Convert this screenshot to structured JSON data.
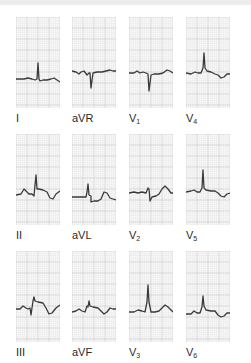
{
  "figure": {
    "colors": {
      "grid_minor": "#e4e4e4",
      "grid_major": "#c8c8c8",
      "trace": "#3a3a3a",
      "label": "#2a2a2a",
      "paper": "#fafafa"
    },
    "layout": {
      "columns_x": [
        16,
        72,
        129,
        186
      ],
      "rows_y": [
        17,
        134,
        251
      ],
      "label_offset_y": 96
    },
    "leads": [
      {
        "id": "I",
        "label": "I",
        "sub": "",
        "col": 0,
        "row": 0,
        "path": "M0,62 L8,62 L12,61 L16,62 L19,63 L21,62 L22,46 L23,62 L24,64 L27,63 L31,63 L35,62 L38,61 L41,63 L44,65"
      },
      {
        "id": "aVR",
        "label": "aVR",
        "sub": "",
        "col": 1,
        "row": 0,
        "path": "M0,54 L4,55 L7,57 L9,55 L12,54 L15,58 L17,56 L18,56 L19,71 L21,56 L25,55 L30,55 L34,54 L38,53 L41,54 L44,54"
      },
      {
        "id": "V1",
        "label": "V",
        "sub": "1",
        "col": 2,
        "row": 0,
        "path": "M0,56 L5,56 L8,54 L11,56 L14,55 L17,56 L19,57 L20,74 L22,58 L25,57 L30,57 L34,56 L38,53 L41,54 L44,56"
      },
      {
        "id": "V4",
        "label": "V",
        "sub": "4",
        "col": 3,
        "row": 0,
        "path": "M0,56 L5,57 L9,55 L12,56 L15,56 L17,51 L18,36 L19,51 L21,54 L25,55 L29,57 L32,58 L35,61 L38,60 L41,57 L44,57"
      },
      {
        "id": "II",
        "label": "II",
        "sub": "",
        "col": 0,
        "row": 1,
        "path": "M0,61 L5,60 L8,55 L11,58 L13,60 L16,60 L18,62 L19,51 L20,41 L21,55 L23,55 L27,56 L31,58 L34,64 L37,65 L40,60 L44,57"
      },
      {
        "id": "aVL",
        "label": "aVL",
        "sub": "",
        "col": 1,
        "row": 1,
        "path": "M0,63 L8,63 L14,63 L15,58 L16,50 L17,61 L19,62 L19,68 L22,67 L26,67 L29,65 L32,58 L35,59 L38,64 L41,65 L44,66"
      },
      {
        "id": "V2",
        "label": "V",
        "sub": "2",
        "col": 2,
        "row": 1,
        "path": "M0,59 L5,58 L9,59 L13,58 L17,59 L19,54 L20,55 L21,67 L23,63 L27,62 L30,60 L33,55 L36,52 L39,55 L42,59 L44,59"
      },
      {
        "id": "V5",
        "label": "V",
        "sub": "5",
        "col": 3,
        "row": 1,
        "path": "M0,58 L5,57 L8,56 L11,58 L14,58 L16,54 L17,36 L18,54 L20,56 L25,57 L29,57 L32,59 L35,62 L38,63 L41,60 L44,59"
      },
      {
        "id": "III",
        "label": "III",
        "sub": "",
        "col": 0,
        "row": 2,
        "path": "M0,58 L4,58 L7,55 L10,57 L12,58 L14,57 L15,64 L17,50 L18,46 L19,50 L22,51 L27,52 L30,57 L33,63 L36,62 L40,57 L44,54"
      },
      {
        "id": "aVF",
        "label": "aVF",
        "sub": "",
        "col": 1,
        "row": 2,
        "path": "M0,61 L4,60 L7,58 L10,60 L13,61 L15,55 L16,56 L17,50 L18,55 L21,56 L26,57 L29,60 L32,63 L35,61 L38,57 L41,58 L44,58"
      },
      {
        "id": "V3",
        "label": "V",
        "sub": "3",
        "col": 2,
        "row": 2,
        "path": "M0,61 L5,61 L9,59 L13,60 L16,61 L18,51 L19,34 L20,51 L22,61 L26,61 L30,60 L33,57 L36,54 L39,56 L42,59 L44,61"
      },
      {
        "id": "V6",
        "label": "V",
        "sub": "6",
        "col": 3,
        "row": 2,
        "path": "M0,63 L5,63 L8,60 L11,62 L14,62 L16,56 L17,45 L18,55 L20,59 L25,60 L29,60 L32,64 L35,66 L38,65 L41,62 L44,62"
      }
    ]
  }
}
